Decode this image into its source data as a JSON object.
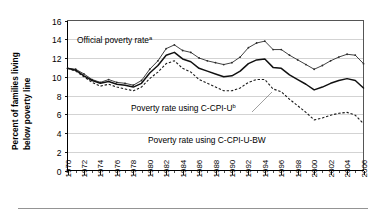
{
  "chart_data": {
    "type": "line",
    "title": "",
    "xlabel": "",
    "ylabel": "Percent of families living below poverty line",
    "ylim": [
      0,
      16
    ],
    "xlim": [
      1970,
      2006
    ],
    "ytick_step": 2,
    "grid": true,
    "legend_position": "inline-annotations",
    "yticks": [
      "0",
      "2",
      "4",
      "6",
      "8",
      "10",
      "12",
      "14",
      "16"
    ],
    "xticks": [
      "1970",
      "1972",
      "1974",
      "1976",
      "1978",
      "1980",
      "1982",
      "1984",
      "1986",
      "1988",
      "1990",
      "1992",
      "1994",
      "1996",
      "1998",
      "2000",
      "2002",
      "2004",
      "2006"
    ],
    "x": [
      1970,
      1971,
      1972,
      1973,
      1974,
      1975,
      1976,
      1977,
      1978,
      1979,
      1980,
      1981,
      1982,
      1983,
      1984,
      1985,
      1986,
      1987,
      1988,
      1989,
      1990,
      1991,
      1992,
      1993,
      1994,
      1995,
      1996,
      1997,
      1998,
      1999,
      2000,
      2001,
      2002,
      2003,
      2004,
      2005,
      2006
    ],
    "series": [
      {
        "name": "Official poverty rate",
        "name_superscript": "a",
        "style": "solid-thin-markers",
        "values": [
          10.9,
          10.8,
          10.3,
          9.7,
          9.4,
          9.7,
          9.4,
          9.3,
          9.1,
          9.6,
          10.8,
          11.7,
          13.0,
          13.4,
          12.8,
          12.6,
          12.0,
          11.7,
          11.5,
          11.3,
          11.5,
          12.1,
          13.1,
          13.6,
          13.8,
          12.9,
          12.9,
          12.3,
          11.8,
          11.3,
          10.8,
          11.2,
          11.7,
          12.1,
          12.4,
          12.3,
          11.4
        ],
        "label_x": 1976.5,
        "label_y": 13.6
      },
      {
        "name": "Poverty rate using C-CPI-U",
        "name_superscript": "b",
        "style": "solid-thick",
        "values": [
          10.9,
          10.7,
          10.1,
          9.6,
          9.3,
          9.5,
          9.2,
          9.1,
          8.9,
          9.3,
          10.4,
          11.2,
          12.3,
          12.6,
          11.9,
          11.6,
          10.9,
          10.6,
          10.3,
          10.0,
          10.1,
          10.6,
          11.4,
          11.8,
          11.9,
          11.0,
          10.9,
          10.2,
          9.7,
          9.2,
          8.6,
          8.9,
          9.3,
          9.6,
          9.8,
          9.6,
          8.8
        ],
        "label_x": 1988.0,
        "label_y": 6.5
      },
      {
        "name": "Poverty rate using C-CPI-U-BW",
        "name_superscript": "",
        "style": "dashed",
        "values": [
          10.9,
          10.6,
          10.0,
          9.4,
          9.0,
          9.2,
          8.9,
          8.7,
          8.5,
          8.9,
          9.8,
          10.5,
          11.4,
          11.7,
          10.9,
          10.5,
          9.7,
          9.3,
          8.9,
          8.5,
          8.5,
          8.8,
          9.4,
          9.7,
          9.7,
          8.7,
          8.4,
          7.6,
          6.9,
          6.2,
          5.4,
          5.6,
          5.9,
          6.1,
          6.2,
          5.9,
          5.0
        ],
        "label_x": 1993.5,
        "label_y": 3.4
      }
    ],
    "annotations": [
      {
        "text": "Official poverty rate",
        "superscript": "a"
      },
      {
        "text": "Poverty rate using C-CPI-U",
        "superscript": "b"
      },
      {
        "text": "Poverty rate using C-CPI-U-BW",
        "superscript": ""
      }
    ]
  }
}
